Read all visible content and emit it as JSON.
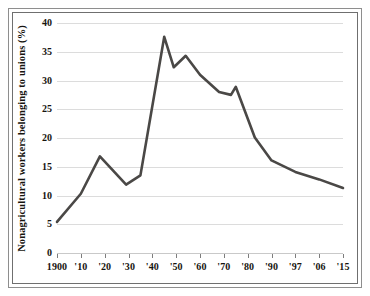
{
  "figure": {
    "frame_style": "double-ruled-box",
    "background": "#ffffff"
  },
  "chart_data": {
    "type": "line",
    "title": "",
    "subtitle": "",
    "xlabel": "",
    "ylabel": "Nonagricultural workers belonging to unions (%)",
    "grid": true,
    "legend": "none",
    "line_color": "#4a4846",
    "xlim": [
      1900,
      2015
    ],
    "ylim": [
      0,
      40
    ],
    "yticks": [
      0,
      5,
      10,
      15,
      20,
      25,
      30,
      35,
      40
    ],
    "ytick_labels": [
      "0",
      "5",
      "10",
      "15",
      "20",
      "25",
      "30",
      "35",
      "40"
    ],
    "xtick_labels": [
      "1900",
      "'10",
      "'20",
      "'30",
      "'40",
      "'50",
      "'60",
      "'70",
      "'80",
      "'90",
      "'97",
      "'06",
      "'15"
    ],
    "xtick_values": [
      1900,
      1910,
      1920,
      1930,
      1940,
      1950,
      1960,
      1970,
      1980,
      1990,
      1997,
      2006,
      2015
    ],
    "x": [
      1900,
      1910,
      1918,
      1929,
      1935,
      1945,
      1949,
      1954,
      1960,
      1968,
      1973,
      1975,
      1983,
      1990,
      1997,
      2006,
      2015
    ],
    "values": [
      5.4,
      10.3,
      16.8,
      11.9,
      13.5,
      37.6,
      32.3,
      34.3,
      31.0,
      28.0,
      27.5,
      28.9,
      20.1,
      16.1,
      14.1,
      12.8,
      11.3
    ],
    "series": [
      {
        "name": "Union membership rate",
        "points": [
          {
            "x": 1900,
            "y": 5.4
          },
          {
            "x": 1910,
            "y": 10.3
          },
          {
            "x": 1918,
            "y": 16.8
          },
          {
            "x": 1929,
            "y": 11.9
          },
          {
            "x": 1935,
            "y": 13.5
          },
          {
            "x": 1945,
            "y": 37.6
          },
          {
            "x": 1949,
            "y": 32.3
          },
          {
            "x": 1954,
            "y": 34.3
          },
          {
            "x": 1960,
            "y": 31.0
          },
          {
            "x": 1968,
            "y": 28.0
          },
          {
            "x": 1973,
            "y": 27.5
          },
          {
            "x": 1975,
            "y": 28.9
          },
          {
            "x": 1983,
            "y": 20.1
          },
          {
            "x": 1990,
            "y": 16.1
          },
          {
            "x": 1997,
            "y": 14.1
          },
          {
            "x": 2006,
            "y": 12.8
          },
          {
            "x": 2015,
            "y": 11.3
          }
        ]
      }
    ]
  }
}
